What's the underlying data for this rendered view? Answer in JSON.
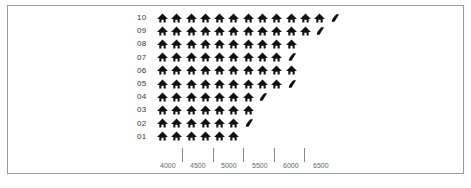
{
  "chart_data": {
    "type": "pictograph",
    "title": "",
    "xlabel": "",
    "ylabel": "",
    "categories": [
      "10",
      "09",
      "08",
      "07",
      "06",
      "05",
      "04",
      "03",
      "02",
      "01"
    ],
    "series": [
      {
        "name": "icon-count",
        "full_icons": [
          12,
          11,
          10,
          9,
          10,
          9,
          7,
          7,
          6,
          6
        ],
        "has_partial": [
          true,
          true,
          false,
          true,
          false,
          true,
          true,
          false,
          true,
          false
        ]
      }
    ],
    "x_tick_labels": [
      "4000",
      "4500",
      "5000",
      "5500",
      "6000",
      "6500"
    ],
    "grid": false,
    "legend": "none",
    "note": "Per-row numeric values not reported: icon-to-scale mapping not verified."
  },
  "rows": [
    {
      "label": "10",
      "full": 12,
      "partial": true
    },
    {
      "label": "09",
      "full": 11,
      "partial": true
    },
    {
      "label": "08",
      "full": 10,
      "partial": false
    },
    {
      "label": "07",
      "full": 9,
      "partial": true
    },
    {
      "label": "06",
      "full": 10,
      "partial": false
    },
    {
      "label": "05",
      "full": 9,
      "partial": true
    },
    {
      "label": "04",
      "full": 7,
      "partial": true
    },
    {
      "label": "03",
      "full": 7,
      "partial": false
    },
    {
      "label": "02",
      "full": 6,
      "partial": true
    },
    {
      "label": "01",
      "full": 6,
      "partial": false
    }
  ],
  "axis": {
    "ticks_x": [
      182,
      213,
      243,
      274,
      304
    ],
    "labels": [
      {
        "text": "4000",
        "x": 160
      },
      {
        "text": "4500",
        "x": 190
      },
      {
        "text": "5000",
        "x": 221
      },
      {
        "text": "5500",
        "x": 252
      },
      {
        "text": "6000",
        "x": 283
      },
      {
        "text": "6500",
        "x": 313
      }
    ]
  },
  "colors": {
    "icon": "#111111",
    "frame_border": "#9a9a9a",
    "tick": "#888888",
    "label": "#666666"
  }
}
